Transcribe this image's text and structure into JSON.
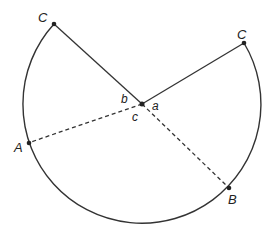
{
  "diagram": {
    "type": "circle-sector-diagram",
    "center": {
      "x": 142,
      "y": 104
    },
    "radius": 119,
    "points": {
      "C_left": {
        "label": "C",
        "x": 54,
        "y": 24
      },
      "C_right": {
        "label": "C",
        "x": 244,
        "y": 43
      },
      "A": {
        "label": "A",
        "x": 28,
        "y": 143
      },
      "B": {
        "label": "B",
        "x": 229,
        "y": 188
      }
    },
    "angle_labels": {
      "a": "a",
      "b": "b",
      "c": "c"
    },
    "colors": {
      "stroke": "#333333",
      "background": "#ffffff"
    }
  }
}
